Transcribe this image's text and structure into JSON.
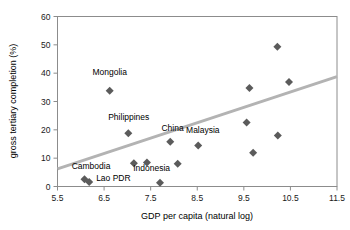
{
  "chart_data": {
    "type": "scatter",
    "title": "",
    "xlabel": "GDP per capita (natural log)",
    "ylabel": "gross tertiary completion (%)",
    "xlim": [
      5.5,
      11.5
    ],
    "ylim": [
      0,
      60
    ],
    "xticks": [
      "5.5",
      "6.5",
      "7.5",
      "8.5",
      "9.5",
      "10.5",
      "11.5"
    ],
    "xtick_values": [
      5.5,
      6.5,
      7.5,
      8.5,
      9.5,
      10.5,
      11.5
    ],
    "yticks": [
      "0",
      "10",
      "20",
      "30",
      "40",
      "50",
      "60"
    ],
    "ytick_values": [
      0,
      10,
      20,
      30,
      40,
      50,
      60
    ],
    "grid": false,
    "legend": false,
    "marker_shape": "diamond",
    "marker_color": "#5b5b5b",
    "trendline": {
      "color": "#b3b3b3",
      "x_start": 5.5,
      "y_start": 6.2,
      "x_end": 11.5,
      "y_end": 38.8
    },
    "points": [
      {
        "label": "Cambodia",
        "x": 6.08,
        "y": 2.6
      },
      {
        "label": "Lao PDR",
        "x": 6.18,
        "y": 1.6
      },
      {
        "label": "Mongolia",
        "x": 6.62,
        "y": 33.8
      },
      {
        "label": "Philippines",
        "x": 7.02,
        "y": 18.8
      },
      {
        "label": "",
        "x": 7.14,
        "y": 8.2
      },
      {
        "label": "",
        "x": 7.42,
        "y": 8.5
      },
      {
        "label": "Indonesia",
        "x": 7.7,
        "y": 1.3
      },
      {
        "label": "China",
        "x": 7.92,
        "y": 15.8
      },
      {
        "label": "",
        "x": 8.08,
        "y": 8.0
      },
      {
        "label": "Malaysia",
        "x": 8.52,
        "y": 14.5
      },
      {
        "label": "",
        "x": 9.56,
        "y": 22.6
      },
      {
        "label": "",
        "x": 9.62,
        "y": 34.8
      },
      {
        "label": "",
        "x": 9.7,
        "y": 11.9
      },
      {
        "label": "",
        "x": 10.22,
        "y": 49.3
      },
      {
        "label": "",
        "x": 10.23,
        "y": 18.0
      },
      {
        "label": "",
        "x": 10.47,
        "y": 36.9
      }
    ],
    "annotations": [
      {
        "text": "Mongolia",
        "x": 6.62,
        "y": 39.5,
        "anchor": "middle"
      },
      {
        "text": "Philippines",
        "x": 7.03,
        "y": 23.5,
        "anchor": "middle"
      },
      {
        "text": "China",
        "x": 7.97,
        "y": 19.6,
        "anchor": "middle"
      },
      {
        "text": "Malaysia",
        "x": 8.62,
        "y": 19.0,
        "anchor": "middle"
      },
      {
        "text": "Indonesia",
        "x": 7.52,
        "y": 5.4,
        "anchor": "middle"
      },
      {
        "text": "Cambodia",
        "x": 6.22,
        "y": 6.3,
        "anchor": "middle"
      },
      {
        "text": "Lao PDR",
        "x": 6.7,
        "y": 1.9,
        "anchor": "middle"
      }
    ]
  }
}
